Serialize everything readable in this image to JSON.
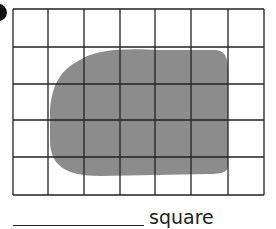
{
  "question": {
    "answer_blank": "",
    "unit_label": "square"
  },
  "grid": {
    "columns": 7,
    "rows": 5,
    "x_lines": [
      13,
      48,
      84,
      120,
      155,
      191,
      228,
      264
    ],
    "y_lines": [
      9,
      47,
      84,
      120,
      157,
      195
    ],
    "line_color": "#222222"
  },
  "shape": {
    "fill_color": "#8c8c8c",
    "description": "irregular rounded shaded shape covering about 15 squares"
  }
}
